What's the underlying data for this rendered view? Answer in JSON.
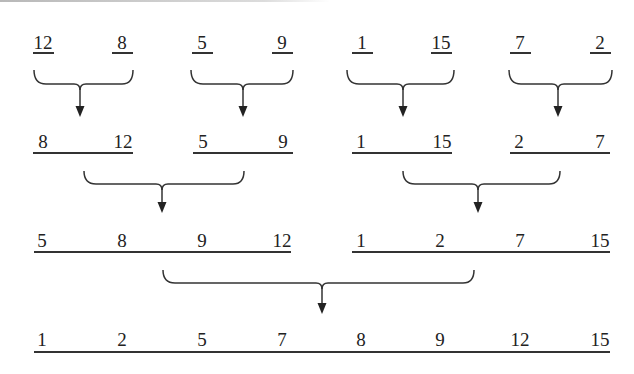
{
  "diagram": {
    "type": "merge-sort",
    "levels": [
      {
        "groups": [
          [
            "12"
          ],
          [
            "8"
          ],
          [
            "5"
          ],
          [
            "9"
          ],
          [
            "1"
          ],
          [
            "15"
          ],
          [
            "7"
          ],
          [
            "2"
          ]
        ]
      },
      {
        "groups": [
          [
            "8",
            "12"
          ],
          [
            "5",
            "9"
          ],
          [
            "1",
            "15"
          ],
          [
            "2",
            "7"
          ]
        ]
      },
      {
        "groups": [
          [
            "5",
            "8",
            "9",
            "12"
          ],
          [
            "1",
            "2",
            "7",
            "15"
          ]
        ]
      },
      {
        "groups": [
          [
            "1",
            "2",
            "5",
            "7",
            "8",
            "9",
            "12",
            "15"
          ]
        ]
      }
    ],
    "line_color": "#333333"
  }
}
